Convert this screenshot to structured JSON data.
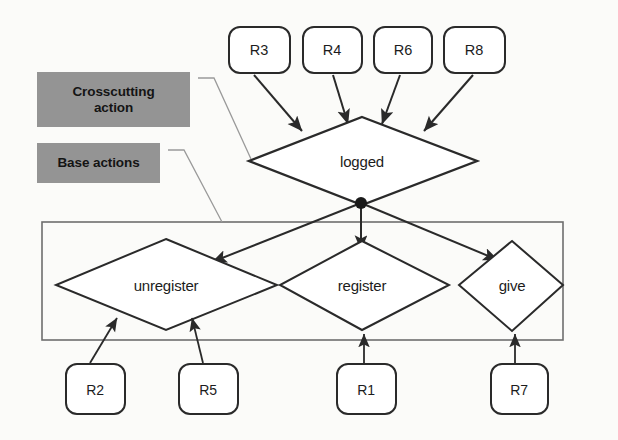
{
  "figure": {
    "type": "activity-diagram",
    "background_color": "#fbfbf9",
    "stroke_color": "#2a2a2a",
    "legend_fill_color": "#949494"
  },
  "legend": {
    "items": [
      {
        "id": "crosscutting",
        "label": "Crosscutting\naction",
        "line1": "Crosscutting",
        "line2": "action"
      },
      {
        "id": "base",
        "label": "Base actions",
        "line1": "Base actions",
        "line2": ""
      }
    ]
  },
  "crosscutting_node": {
    "label": "logged",
    "shape": "diamond"
  },
  "base_nodes": [
    {
      "label": "unregister",
      "shape": "diamond"
    },
    {
      "label": "register",
      "shape": "diamond"
    },
    {
      "label": "give",
      "shape": "diamond"
    }
  ],
  "top_requirements": [
    {
      "label": "R3"
    },
    {
      "label": "R4"
    },
    {
      "label": "R6"
    },
    {
      "label": "R8"
    }
  ],
  "bottom_requirements": [
    {
      "label": "R2"
    },
    {
      "label": "R5"
    },
    {
      "label": "R1"
    },
    {
      "label": "R7"
    }
  ],
  "edges": [
    {
      "from": "R3",
      "to": "logged"
    },
    {
      "from": "R4",
      "to": "logged"
    },
    {
      "from": "R6",
      "to": "logged"
    },
    {
      "from": "R8",
      "to": "logged"
    },
    {
      "from": "logged",
      "to": "unregister"
    },
    {
      "from": "logged",
      "to": "register"
    },
    {
      "from": "logged",
      "to": "give"
    },
    {
      "from": "R2",
      "to": "unregister"
    },
    {
      "from": "R5",
      "to": "unregister"
    },
    {
      "from": "R1",
      "to": "register"
    },
    {
      "from": "R7",
      "to": "give"
    }
  ]
}
